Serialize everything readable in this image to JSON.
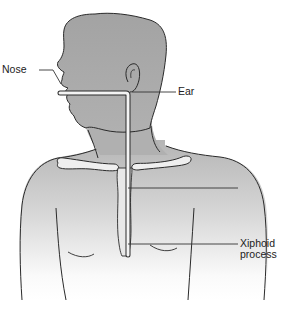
{
  "diagram": {
    "labels": {
      "nose": "Nose",
      "ear": "Ear",
      "xiphoid_line1": "Xiphoid",
      "xiphoid_line2": "process"
    },
    "colors": {
      "head_fill": "#a9a9a9",
      "torso_fill_top": "#b8b8b8",
      "torso_fill_bottom": "#ffffff",
      "outline": "#2a2a2a",
      "tube": "#f2f2f2",
      "leader_line": "#333333"
    }
  }
}
